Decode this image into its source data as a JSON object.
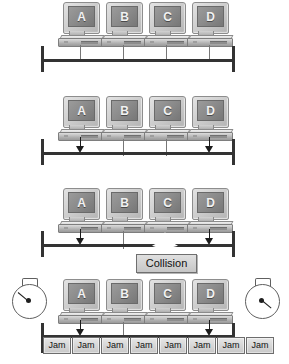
{
  "diagram": {
    "background": "#ffffff",
    "accent_line_color": "#333333",
    "box_fill": "#d6d6d6"
  },
  "stations": [
    {
      "label": "A",
      "name": "computer-a"
    },
    {
      "label": "B",
      "name": "computer-b"
    },
    {
      "label": "C",
      "name": "computer-c"
    },
    {
      "label": "D",
      "name": "computer-d"
    }
  ],
  "rows": [
    {
      "id": "row-1",
      "name": "step-idle-bus",
      "transmit_from": [],
      "has_collision": false,
      "has_jam": false,
      "has_clocks": false
    },
    {
      "id": "row-2",
      "name": "step-simultaneous-transmit",
      "transmit_from": [
        "A",
        "D"
      ],
      "has_collision": false,
      "has_jam": false,
      "has_clocks": false
    },
    {
      "id": "row-3",
      "name": "step-collision-detected",
      "transmit_from": [
        "A",
        "D"
      ],
      "has_collision": true,
      "has_jam": false,
      "has_clocks": false
    },
    {
      "id": "row-4",
      "name": "step-jam-signal-backoff",
      "transmit_from": [
        "A",
        "D"
      ],
      "has_collision": false,
      "has_jam": true,
      "has_clocks": true
    }
  ],
  "collision": {
    "label": "Collision",
    "icon": "starburst-icon"
  },
  "jam": {
    "label": "Jam",
    "count": 8,
    "labels": [
      "Jam",
      "Jam",
      "Jam",
      "Jam",
      "Jam",
      "Jam",
      "Jam",
      "Jam"
    ]
  },
  "clocks": [
    {
      "name": "backoff-timer-left",
      "hand_angle_deg": 45,
      "hand_from": "edge"
    },
    {
      "name": "backoff-timer-right",
      "hand_angle_deg": 45,
      "hand_from": "hub"
    }
  ]
}
